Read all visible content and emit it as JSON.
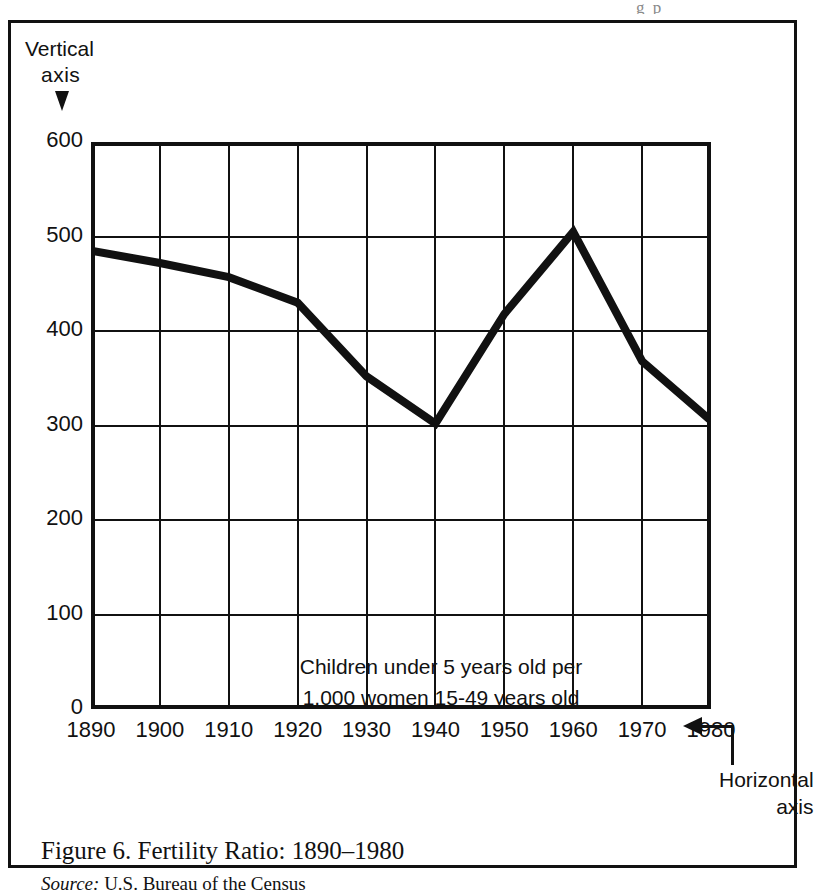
{
  "page_bleed_text": "g p",
  "figure": {
    "caption": "Figure 6. Fertility Ratio: 1890–1980",
    "source_label": "Source:",
    "source_text": "U.S. Bureau of the Census"
  },
  "annotations": {
    "vertical_axis_line1": "Vertical",
    "vertical_axis_line2": "axis",
    "vertical_axis_arrow_icon": "down-arrow-icon",
    "horizontal_axis_line1": "Horizontal",
    "horizontal_axis_line2": "axis",
    "horizontal_axis_arrow_icon": "left-arrow-icon"
  },
  "chart_data": {
    "type": "line",
    "title": "Figure 6. Fertility Ratio: 1890–1980",
    "in_chart_note_line1": "Children under 5 years old per",
    "in_chart_note_line2": "1,000 women 15-49 years old",
    "xlabel": "",
    "ylabel": "",
    "x": [
      1890,
      1900,
      1910,
      1920,
      1930,
      1940,
      1950,
      1960,
      1970,
      1980
    ],
    "categories": [
      "1890",
      "1900",
      "1910",
      "1920",
      "1930",
      "1940",
      "1950",
      "1960",
      "1970",
      "1980"
    ],
    "values": [
      485,
      472,
      457,
      430,
      352,
      302,
      418,
      505,
      368,
      305
    ],
    "series": [
      {
        "name": "Children under 5 years old per 1,000 women 15-49 years old",
        "values": [
          485,
          472,
          457,
          430,
          352,
          302,
          418,
          505,
          368,
          305
        ]
      }
    ],
    "xlim": [
      1890,
      1980
    ],
    "ylim": [
      0,
      600
    ],
    "y_ticks": [
      0,
      100,
      200,
      300,
      400,
      500,
      600
    ],
    "y_tick_labels": [
      "0",
      "100",
      "200",
      "300",
      "400",
      "500",
      "600"
    ],
    "x_ticks": [
      1890,
      1900,
      1910,
      1920,
      1930,
      1940,
      1950,
      1960,
      1970,
      1980
    ],
    "grid": true,
    "legend": "none",
    "line_color": "#111111",
    "grid_color": "#111111",
    "background_color": "#ffffff"
  }
}
